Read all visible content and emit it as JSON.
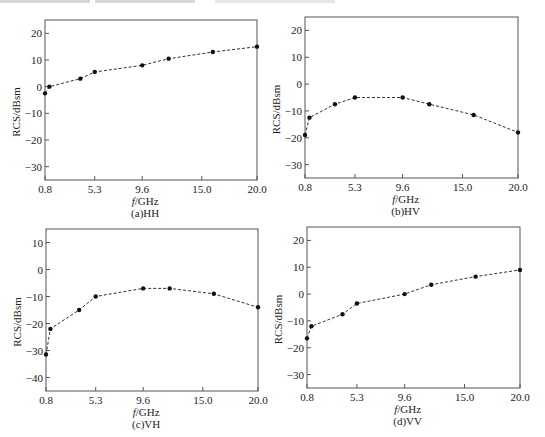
{
  "chart_data": [
    {
      "type": "line",
      "panel": "a",
      "caption": "(a)HH",
      "xlabel": "f/GHz",
      "ylabel": "RCS/dBsm",
      "xticks": [
        0.8,
        5.3,
        9.6,
        15.0,
        20.0
      ],
      "xtick_labels": [
        "0.8",
        "5.3",
        "9.6",
        "15.0",
        "20.0"
      ],
      "yticks": [
        20,
        10,
        0,
        -10,
        -20,
        -30
      ],
      "ylim": [
        -35,
        25
      ],
      "xlim": [
        0.8,
        20.0
      ],
      "grid": false,
      "line_style": "dashed",
      "x": [
        0.8,
        1.2,
        4.0,
        5.3,
        9.6,
        12.0,
        16.0,
        20.0
      ],
      "y": [
        -2.5,
        0.0,
        3.0,
        5.5,
        8.0,
        10.5,
        13.0,
        15.0
      ]
    },
    {
      "type": "line",
      "panel": "b",
      "caption": "(b)HV",
      "xlabel": "f/GHz",
      "ylabel": "RCS/dBsm",
      "xticks": [
        0.8,
        5.3,
        9.6,
        15.0,
        20.0
      ],
      "xtick_labels": [
        "0.8",
        "5.3",
        "9.6",
        "15.0",
        "20.0"
      ],
      "yticks": [
        20,
        10,
        0,
        -10,
        -20,
        -30
      ],
      "ylim": [
        -35,
        25
      ],
      "xlim": [
        0.8,
        20.0
      ],
      "grid": false,
      "line_style": "dashed",
      "x": [
        0.8,
        1.2,
        3.5,
        5.3,
        9.6,
        12.0,
        16.0,
        20.0
      ],
      "y": [
        -19.0,
        -12.5,
        -7.5,
        -5.0,
        -5.0,
        -7.5,
        -11.5,
        -18.0
      ]
    },
    {
      "type": "line",
      "panel": "c",
      "caption": "(c)VH",
      "xlabel": "f/GHz",
      "ylabel": "RCS/dBsm",
      "xticks": [
        0.8,
        5.3,
        9.6,
        15.0,
        20.0
      ],
      "xtick_labels": [
        "0.8",
        "5.3",
        "9.6",
        "15.0",
        "20.0"
      ],
      "yticks": [
        10,
        0,
        -10,
        -20,
        -30,
        -40
      ],
      "ylim": [
        -45,
        15
      ],
      "xlim": [
        0.8,
        20.0
      ],
      "grid": false,
      "line_style": "dashed",
      "x": [
        0.8,
        1.2,
        3.8,
        5.3,
        9.6,
        12.0,
        16.0,
        20.0
      ],
      "y": [
        -31.5,
        -22.0,
        -15.0,
        -10.0,
        -7.0,
        -7.0,
        -9.0,
        -14.0
      ]
    },
    {
      "type": "line",
      "panel": "d",
      "caption": "(d)VV",
      "xlabel": "f/GHz",
      "ylabel": "RCS/dBsm",
      "xticks": [
        0.8,
        5.3,
        9.6,
        15.0,
        20.0
      ],
      "xtick_labels": [
        "0.8",
        "5.3",
        "9.6",
        "15.0",
        "20.0"
      ],
      "yticks": [
        20,
        10,
        0,
        -10,
        -20,
        -30
      ],
      "ylim": [
        -35,
        25
      ],
      "xlim": [
        0.8,
        20.0
      ],
      "grid": false,
      "line_style": "dashed",
      "x": [
        0.8,
        1.2,
        4.0,
        5.3,
        9.6,
        12.0,
        16.0,
        20.0
      ],
      "y": [
        -16.5,
        -12.0,
        -7.5,
        -3.5,
        0.0,
        3.5,
        6.5,
        9.0
      ]
    }
  ],
  "layout": {
    "panels": [
      {
        "left": 45,
        "top": 20,
        "right": 257,
        "bottom": 180
      },
      {
        "left": 305,
        "top": 17,
        "right": 518,
        "bottom": 178
      },
      {
        "left": 46,
        "top": 229,
        "right": 258,
        "bottom": 391
      },
      {
        "left": 307,
        "top": 227,
        "right": 520,
        "bottom": 388
      }
    ],
    "line_color": "#333333",
    "frame_color": "#555555"
  }
}
